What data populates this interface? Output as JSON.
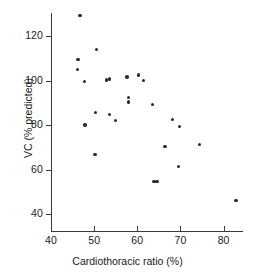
{
  "chart_data": {
    "type": "scatter",
    "title": "",
    "xlabel": "Cardiothoracic ratio (%)",
    "ylabel": "VC (% predicted)",
    "xlim": [
      40,
      84.5
    ],
    "ylim": [
      32.5,
      130.5
    ],
    "xticks": [
      40,
      50,
      60,
      70,
      80
    ],
    "yticks": [
      40,
      60,
      80,
      100,
      120
    ],
    "xtick_labels": [
      "40",
      "50",
      "60",
      "70",
      "80"
    ],
    "ytick_labels": [
      "40",
      "60",
      "80",
      "100",
      "120"
    ],
    "grid": false,
    "legend": null,
    "marker": "filled-circle",
    "marker_color": "#2b2b2b",
    "axis_color": "#3a3a3a",
    "background": "#ffffff",
    "n_points": 30,
    "points": [
      {
        "x": 46.7,
        "y": 129.5
      },
      {
        "x": 50.5,
        "y": 114.1
      },
      {
        "x": 46.3,
        "y": 109.6
      },
      {
        "x": 46.1,
        "y": 105.2
      },
      {
        "x": 47.8,
        "y": 99.8
      },
      {
        "x": 52.9,
        "y": 100.3
      },
      {
        "x": 53.6,
        "y": 100.8
      },
      {
        "x": 57.6,
        "y": 101.8
      },
      {
        "x": 60.3,
        "y": 102.7
      },
      {
        "x": 61.5,
        "y": 100.1
      },
      {
        "x": 57.9,
        "y": 92.5
      },
      {
        "x": 57.9,
        "y": 90.5
      },
      {
        "x": 63.5,
        "y": 89.3
      },
      {
        "x": 50.3,
        "y": 85.9
      },
      {
        "x": 53.6,
        "y": 85.0
      },
      {
        "x": 55.0,
        "y": 82.1
      },
      {
        "x": 47.9,
        "y": 80.1
      },
      {
        "x": 68.2,
        "y": 82.5
      },
      {
        "x": 69.8,
        "y": 79.5
      },
      {
        "x": 50.2,
        "y": 66.9
      },
      {
        "x": 66.4,
        "y": 70.5
      },
      {
        "x": 74.4,
        "y": 71.5
      },
      {
        "x": 69.5,
        "y": 61.4
      },
      {
        "x": 63.9,
        "y": 54.8
      },
      {
        "x": 64.6,
        "y": 54.8
      },
      {
        "x": 82.9,
        "y": 46.2
      }
    ]
  },
  "axes": {
    "x_title": "Cardiothoracic ratio (%)",
    "y_title": "VC (% predicted)"
  }
}
